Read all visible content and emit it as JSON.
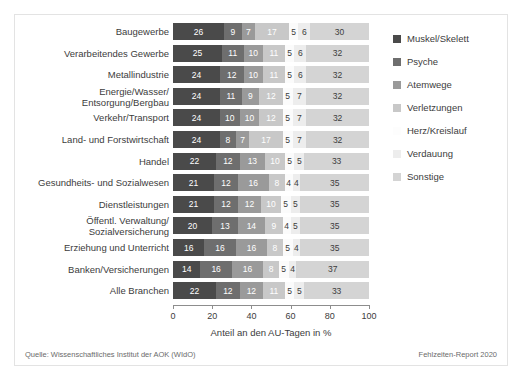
{
  "chart_data": {
    "type": "bar",
    "orientation": "horizontal",
    "stacked": true,
    "title": "",
    "xlabel": "Anteil an den AU-Tagen in %",
    "ylabel": "",
    "xlim": [
      0,
      100
    ],
    "xticks": [
      "0",
      "20",
      "40",
      "60",
      "80",
      "100"
    ],
    "xtick_values": [
      0,
      20,
      40,
      60,
      80,
      100
    ],
    "grid": false,
    "legend_position": "right",
    "categories": [
      "Baugewerbe",
      "Verarbeitendes Gewerbe",
      "Metallindustrie",
      "Energie/Wasser/\nEntsorgung/Bergbau",
      "Verkehr/Transport",
      "Land- und Forstwirtschaft",
      "Handel",
      "Gesundheits- und Sozialwesen",
      "Dienstleistungen",
      "Öffentl. Verwaltung/\nSozialversicherung",
      "Erziehung und Unterricht",
      "Banken/Versicherungen",
      "Alle Branchen"
    ],
    "series": [
      {
        "name": "Muskel/Skelett",
        "color": "#4a4a4a",
        "label_color": "#ffffff",
        "values": [
          26,
          25,
          24,
          24,
          24,
          24,
          22,
          21,
          21,
          20,
          16,
          14,
          22
        ]
      },
      {
        "name": "Psyche",
        "color": "#6e6e6e",
        "label_color": "#ffffff",
        "values": [
          9,
          11,
          12,
          11,
          10,
          8,
          12,
          12,
          12,
          13,
          16,
          16,
          12
        ]
      },
      {
        "name": "Atemwege",
        "color": "#9a9a9a",
        "label_color": "#ffffff",
        "values": [
          7,
          10,
          10,
          9,
          10,
          7,
          13,
          16,
          12,
          14,
          16,
          16,
          12
        ]
      },
      {
        "name": "Verletzungen",
        "color": "#c8c8c8",
        "label_color": "#ffffff",
        "values": [
          17,
          11,
          11,
          12,
          12,
          17,
          10,
          8,
          10,
          9,
          8,
          8,
          11
        ]
      },
      {
        "name": "Herz/Kreislauf",
        "color": "#fbfbfb",
        "label_color": "#3c3c3c",
        "values": [
          5,
          5,
          5,
          5,
          5,
          5,
          5,
          4,
          5,
          4,
          5,
          5,
          5
        ]
      },
      {
        "name": "Verdauung",
        "color": "#ededed",
        "label_color": "#3c3c3c",
        "values": [
          6,
          6,
          6,
          7,
          7,
          7,
          5,
          4,
          5,
          5,
          4,
          4,
          5
        ]
      },
      {
        "name": "Sonstige",
        "color": "#d4d4d4",
        "label_color": "#3c3c3c",
        "values": [
          30,
          32,
          32,
          32,
          32,
          32,
          33,
          35,
          35,
          35,
          35,
          37,
          33
        ]
      }
    ]
  },
  "legend": {
    "items": [
      {
        "label": "Muskel/Skelett",
        "color": "#4a4a4a"
      },
      {
        "label": "Psyche",
        "color": "#6e6e6e"
      },
      {
        "label": "Atemwege",
        "color": "#9a9a9a"
      },
      {
        "label": "Verletzungen",
        "color": "#c8c8c8"
      },
      {
        "label": "Herz/Kreislauf",
        "color": "#fdfdfd"
      },
      {
        "label": "Verdauung",
        "color": "#ededed"
      },
      {
        "label": "Sonstige",
        "color": "#d4d4d4"
      }
    ]
  },
  "footer": {
    "source": "Quelle: Wissenschaftliches Institut der AOK (WIdO)",
    "report": "Fehlzeiten-Report 2020"
  }
}
